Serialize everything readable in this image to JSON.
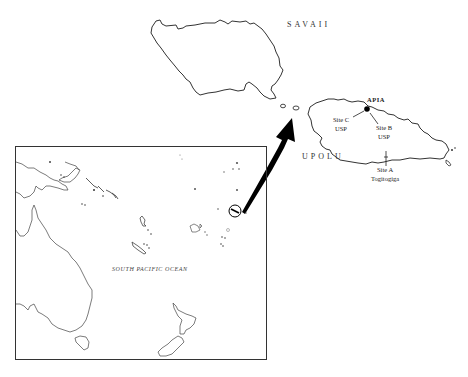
{
  "map": {
    "islands": {
      "savaii": {
        "label": "SAVAII"
      },
      "upolu": {
        "label": "UPOLU"
      }
    },
    "places": {
      "apia": {
        "label": "APIA"
      },
      "site_a": {
        "line1": "Site A",
        "line2": "Togitogiga"
      },
      "site_b": {
        "line1": "Site B",
        "line2": "USP"
      },
      "site_c": {
        "line1": "Site C",
        "line2": "USP"
      }
    },
    "inset": {
      "ocean_label": "SOUTH PACIFIC OCEAN"
    },
    "colors": {
      "outline": "#333333",
      "arrow": "#000000",
      "background": "#ffffff"
    }
  }
}
